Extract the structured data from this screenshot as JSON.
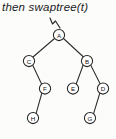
{
  "figure": {
    "caption": "then swaptree(t)",
    "background_color": "#fcfcfa",
    "stroke_color": "#262626",
    "node_fill": "#ffffff",
    "width": 116,
    "height": 139
  },
  "pointer": {
    "name": "t-pointer-arrow",
    "description": "hand-drawn arrow pointing down-right into the root node",
    "path": "M 50 18 L 52.5 24 L 55.5 21 L 60 28"
  },
  "diagram": {
    "type": "binary-tree",
    "root": "A",
    "nodes": [
      {
        "id": "A",
        "label": "A",
        "cx": 59.0,
        "cy": 35.0,
        "r": 5.6,
        "depth": 0
      },
      {
        "id": "C",
        "label": "C",
        "cx": 29.0,
        "cy": 61.0,
        "r": 5.6,
        "depth": 1
      },
      {
        "id": "B",
        "label": "B",
        "cx": 87.0,
        "cy": 61.0,
        "r": 5.6,
        "depth": 1
      },
      {
        "id": "F",
        "label": "F",
        "cx": 45.0,
        "cy": 88.5,
        "r": 5.6,
        "depth": 2
      },
      {
        "id": "E",
        "label": "E",
        "cx": 73.0,
        "cy": 88.5,
        "r": 5.6,
        "depth": 2
      },
      {
        "id": "D",
        "label": "D",
        "cx": 103.0,
        "cy": 88.5,
        "r": 5.6,
        "depth": 2
      },
      {
        "id": "H",
        "label": "H",
        "cx": 33.0,
        "cy": 118.0,
        "r": 5.6,
        "depth": 3
      },
      {
        "id": "G",
        "label": "G",
        "cx": 90.0,
        "cy": 118.0,
        "r": 5.6,
        "depth": 3
      }
    ],
    "edges": [
      {
        "from": "A",
        "to": "C",
        "side": "left",
        "x1": 54.5,
        "y1": 38.5,
        "x2": 33.0,
        "y2": 57.0
      },
      {
        "from": "A",
        "to": "B",
        "side": "right",
        "x1": 63.5,
        "y1": 38.5,
        "x2": 83.5,
        "y2": 57.0
      },
      {
        "from": "C",
        "to": "F",
        "side": "right",
        "x1": 32.5,
        "y1": 64.8,
        "x2": 41.8,
        "y2": 84.5
      },
      {
        "from": "B",
        "to": "E",
        "side": "left",
        "x1": 83.3,
        "y1": 64.8,
        "x2": 76.0,
        "y2": 84.5
      },
      {
        "from": "B",
        "to": "D",
        "side": "right",
        "x1": 90.5,
        "y1": 64.8,
        "x2": 100.5,
        "y2": 84.5
      },
      {
        "from": "F",
        "to": "H",
        "side": "left",
        "x1": 42.0,
        "y1": 92.5,
        "x2": 36.0,
        "y2": 113.8
      },
      {
        "from": "D",
        "to": "G",
        "side": "left",
        "x1": 100.0,
        "y1": 92.5,
        "x2": 93.5,
        "y2": 113.8
      }
    ]
  }
}
